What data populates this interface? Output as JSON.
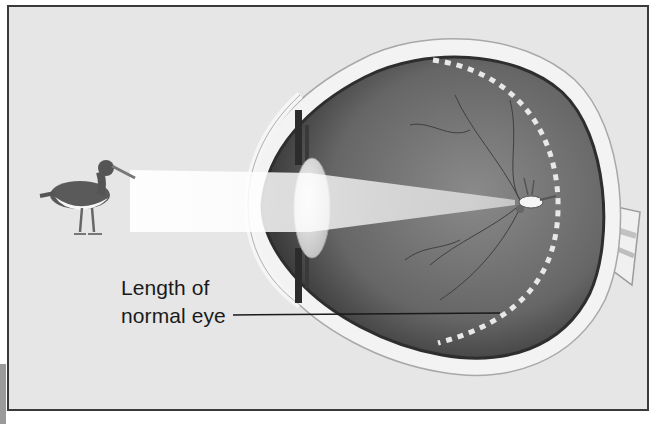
{
  "figure": {
    "labels": {
      "eye_length_line1": "Length of",
      "eye_length_line2": "normal eye"
    },
    "colors": {
      "background": "#e6e6e6",
      "frame_border": "#3a3a3a",
      "eye_interior": "#6f6f6f",
      "sclera": "#f2f2f2",
      "light_beam": "#ffffff",
      "text": "#1a1a1a"
    },
    "parts": [
      "bird-object",
      "light-beam",
      "cornea",
      "lens",
      "iris",
      "retina",
      "optic-nerve",
      "inverted-image",
      "retina-dotted-line",
      "pointer-line"
    ]
  }
}
